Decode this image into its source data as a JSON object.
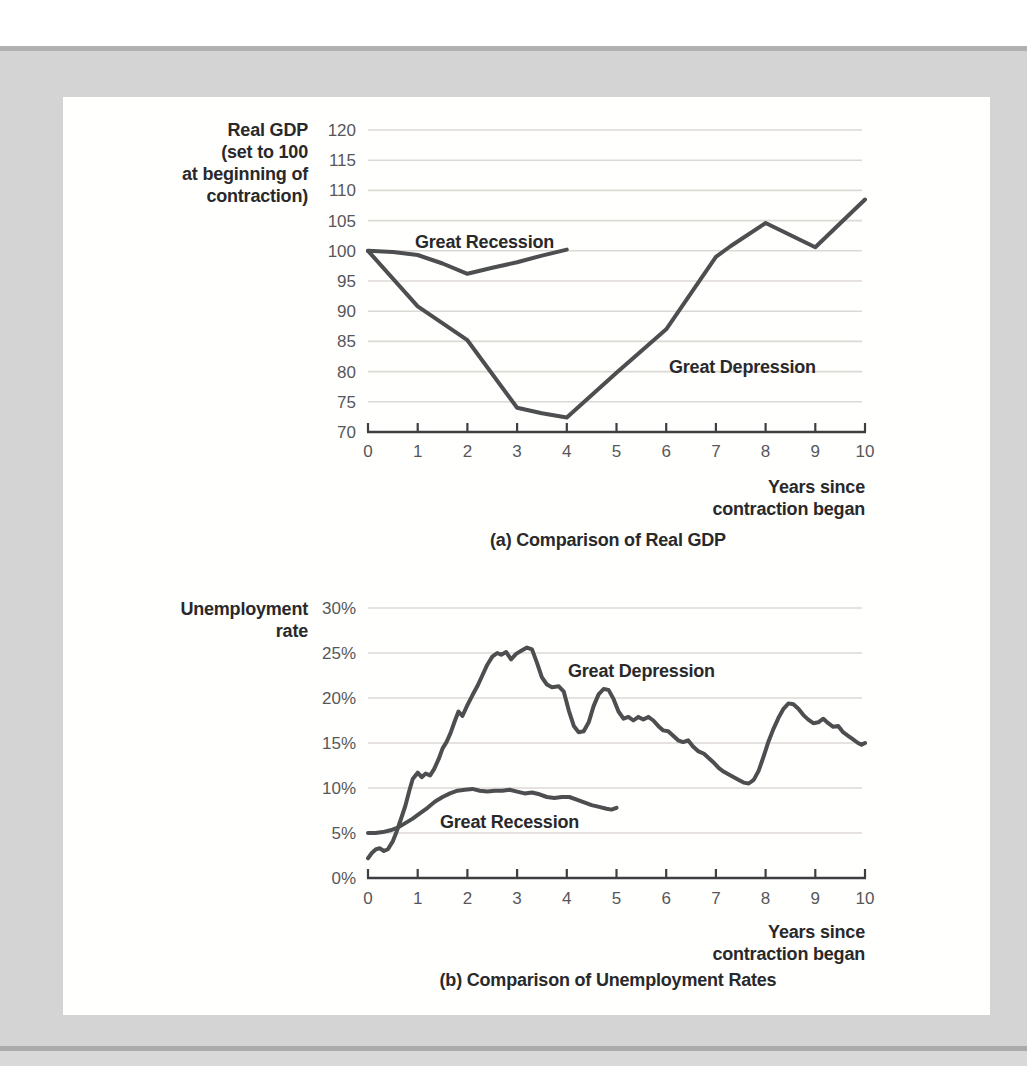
{
  "page": {
    "background_color": "#ffffff",
    "band_color": "#d3d4d3",
    "band_edge_color": "#b1b1b1",
    "panel_color": "#fffffe"
  },
  "style": {
    "line_color": "#4d4e50",
    "grid_color": "#dcd9d4",
    "axis_color": "#3e3e41",
    "tick_text_color": "#57575a",
    "label_text_color": "#29292b"
  },
  "chart_data": [
    {
      "type": "line",
      "title": "(a) Comparison of Real GDP",
      "ylabel_lines": [
        "Real GDP",
        "(set to 100",
        "at beginning of",
        "contraction)"
      ],
      "xlabel_lines": [
        "Years since",
        "contraction began"
      ],
      "xlim": [
        0,
        10
      ],
      "ylim": [
        70,
        120
      ],
      "xticks": [
        0,
        1,
        2,
        3,
        4,
        5,
        6,
        7,
        8,
        9,
        10
      ],
      "xtick_labels": [
        "0",
        "1",
        "2",
        "3",
        "4",
        "5",
        "6",
        "7",
        "8",
        "9",
        "10"
      ],
      "yticks": [
        70,
        75,
        80,
        85,
        90,
        95,
        100,
        105,
        110,
        115,
        120
      ],
      "ytick_labels": [
        "70",
        "75",
        "80",
        "85",
        "90",
        "95",
        "100",
        "105",
        "110",
        "115",
        "120"
      ],
      "grid": true,
      "legend_position": "inline-annotations",
      "series": [
        {
          "name": "Great Recession",
          "x": [
            0,
            0.5,
            1,
            1.5,
            2,
            2.5,
            3,
            3.5,
            4
          ],
          "y": [
            100,
            99.8,
            99.3,
            97.9,
            96.2,
            97.2,
            98.1,
            99.2,
            100.2
          ]
        },
        {
          "name": "Great Depression",
          "x": [
            0,
            1,
            2,
            3,
            3.5,
            4,
            5,
            6,
            7,
            7.3,
            8,
            9,
            10
          ],
          "y": [
            100,
            90.8,
            85.2,
            74,
            73.1,
            72.4,
            79.8,
            87,
            99,
            100.8,
            104.6,
            100.6,
            108.5
          ]
        }
      ]
    },
    {
      "type": "line",
      "title": "(b) Comparison of Unemployment Rates",
      "ylabel_lines": [
        "Unemployment",
        "rate"
      ],
      "xlabel_lines": [
        "Years since",
        "contraction began"
      ],
      "xlim": [
        0,
        10
      ],
      "ylim": [
        0,
        30
      ],
      "xticks": [
        0,
        1,
        2,
        3,
        4,
        5,
        6,
        7,
        8,
        9,
        10
      ],
      "xtick_labels": [
        "0",
        "1",
        "2",
        "3",
        "4",
        "5",
        "6",
        "7",
        "8",
        "9",
        "10"
      ],
      "yticks": [
        0,
        5,
        10,
        15,
        20,
        25,
        30
      ],
      "ytick_labels": [
        "0%",
        "5%",
        "10%",
        "15%",
        "20%",
        "25%",
        "30%"
      ],
      "grid": true,
      "legend_position": "inline-annotations",
      "series": [
        {
          "name": "Great Recession",
          "points": [
            [
              0,
              5.0
            ],
            [
              0.15,
              5.0
            ],
            [
              0.3,
              5.1
            ],
            [
              0.45,
              5.3
            ],
            [
              0.6,
              5.6
            ],
            [
              0.75,
              6.1
            ],
            [
              0.9,
              6.6
            ],
            [
              1.05,
              7.2
            ],
            [
              1.2,
              7.8
            ],
            [
              1.35,
              8.5
            ],
            [
              1.5,
              9.0
            ],
            [
              1.65,
              9.4
            ],
            [
              1.8,
              9.7
            ],
            [
              1.95,
              9.8
            ],
            [
              2.1,
              9.9
            ],
            [
              2.25,
              9.7
            ],
            [
              2.4,
              9.6
            ],
            [
              2.55,
              9.7
            ],
            [
              2.7,
              9.7
            ],
            [
              2.85,
              9.8
            ],
            [
              3.0,
              9.6
            ],
            [
              3.15,
              9.4
            ],
            [
              3.3,
              9.5
            ],
            [
              3.45,
              9.3
            ],
            [
              3.6,
              9.0
            ],
            [
              3.75,
              8.9
            ],
            [
              3.9,
              9.0
            ],
            [
              4.05,
              9.0
            ],
            [
              4.2,
              8.7
            ],
            [
              4.35,
              8.4
            ],
            [
              4.5,
              8.1
            ],
            [
              4.65,
              7.9
            ],
            [
              4.8,
              7.7
            ],
            [
              4.9,
              7.6
            ],
            [
              5.0,
              7.8
            ]
          ]
        },
        {
          "name": "Great Depression",
          "points": [
            [
              0,
              2.2
            ],
            [
              0.08,
              2.8
            ],
            [
              0.16,
              3.2
            ],
            [
              0.24,
              3.3
            ],
            [
              0.32,
              3.0
            ],
            [
              0.4,
              3.2
            ],
            [
              0.5,
              4.1
            ],
            [
              0.58,
              5.2
            ],
            [
              0.66,
              6.5
            ],
            [
              0.75,
              8.0
            ],
            [
              0.83,
              9.7
            ],
            [
              0.9,
              11.0
            ],
            [
              1.0,
              11.7
            ],
            [
              1.08,
              11.2
            ],
            [
              1.16,
              11.6
            ],
            [
              1.25,
              11.4
            ],
            [
              1.33,
              12.1
            ],
            [
              1.42,
              13.2
            ],
            [
              1.5,
              14.4
            ],
            [
              1.58,
              15.1
            ],
            [
              1.66,
              16.1
            ],
            [
              1.75,
              17.5
            ],
            [
              1.82,
              18.5
            ],
            [
              1.9,
              18.0
            ],
            [
              2.0,
              19.2
            ],
            [
              2.1,
              20.3
            ],
            [
              2.2,
              21.3
            ],
            [
              2.3,
              22.5
            ],
            [
              2.4,
              23.7
            ],
            [
              2.5,
              24.6
            ],
            [
              2.6,
              25.0
            ],
            [
              2.68,
              24.8
            ],
            [
              2.78,
              25.1
            ],
            [
              2.88,
              24.3
            ],
            [
              2.98,
              24.9
            ],
            [
              3.1,
              25.3
            ],
            [
              3.2,
              25.6
            ],
            [
              3.3,
              25.4
            ],
            [
              3.4,
              23.9
            ],
            [
              3.5,
              22.3
            ],
            [
              3.6,
              21.5
            ],
            [
              3.7,
              21.2
            ],
            [
              3.84,
              21.3
            ],
            [
              3.94,
              20.7
            ],
            [
              4.04,
              18.6
            ],
            [
              4.14,
              16.9
            ],
            [
              4.24,
              16.2
            ],
            [
              4.34,
              16.3
            ],
            [
              4.44,
              17.3
            ],
            [
              4.54,
              19.1
            ],
            [
              4.64,
              20.4
            ],
            [
              4.74,
              21.0
            ],
            [
              4.84,
              20.9
            ],
            [
              4.94,
              19.9
            ],
            [
              5.04,
              18.5
            ],
            [
              5.14,
              17.7
            ],
            [
              5.24,
              17.9
            ],
            [
              5.34,
              17.5
            ],
            [
              5.44,
              17.9
            ],
            [
              5.54,
              17.6
            ],
            [
              5.64,
              17.9
            ],
            [
              5.74,
              17.5
            ],
            [
              5.84,
              16.9
            ],
            [
              5.94,
              16.4
            ],
            [
              6.04,
              16.3
            ],
            [
              6.14,
              15.8
            ],
            [
              6.24,
              15.3
            ],
            [
              6.34,
              15.1
            ],
            [
              6.44,
              15.3
            ],
            [
              6.54,
              14.6
            ],
            [
              6.64,
              14.1
            ],
            [
              6.76,
              13.8
            ],
            [
              6.86,
              13.3
            ],
            [
              6.96,
              12.8
            ],
            [
              7.06,
              12.2
            ],
            [
              7.16,
              11.8
            ],
            [
              7.26,
              11.5
            ],
            [
              7.36,
              11.2
            ],
            [
              7.46,
              10.9
            ],
            [
              7.56,
              10.6
            ],
            [
              7.66,
              10.5
            ],
            [
              7.76,
              10.9
            ],
            [
              7.86,
              11.9
            ],
            [
              7.96,
              13.5
            ],
            [
              8.06,
              15.2
            ],
            [
              8.16,
              16.6
            ],
            [
              8.26,
              17.8
            ],
            [
              8.36,
              18.8
            ],
            [
              8.46,
              19.4
            ],
            [
              8.56,
              19.3
            ],
            [
              8.66,
              18.8
            ],
            [
              8.76,
              18.1
            ],
            [
              8.86,
              17.6
            ],
            [
              8.96,
              17.2
            ],
            [
              9.06,
              17.3
            ],
            [
              9.16,
              17.7
            ],
            [
              9.26,
              17.2
            ],
            [
              9.36,
              16.8
            ],
            [
              9.46,
              16.9
            ],
            [
              9.56,
              16.2
            ],
            [
              9.66,
              15.8
            ],
            [
              9.76,
              15.4
            ],
            [
              9.86,
              15.0
            ],
            [
              9.93,
              14.8
            ],
            [
              10,
              15.0
            ]
          ]
        }
      ]
    }
  ]
}
